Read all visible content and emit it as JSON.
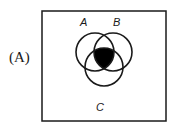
{
  "option": {
    "label": "(A)"
  },
  "diagram": {
    "type": "venn-3",
    "universe_box": true,
    "sets": [
      {
        "name": "A",
        "label": "A"
      },
      {
        "name": "B",
        "label": "B"
      },
      {
        "name": "C",
        "label": "C"
      }
    ],
    "shaded_region": "A ∩ B ∩ C",
    "shade_color": "#000000",
    "stroke_color": "#1a1a1a"
  }
}
